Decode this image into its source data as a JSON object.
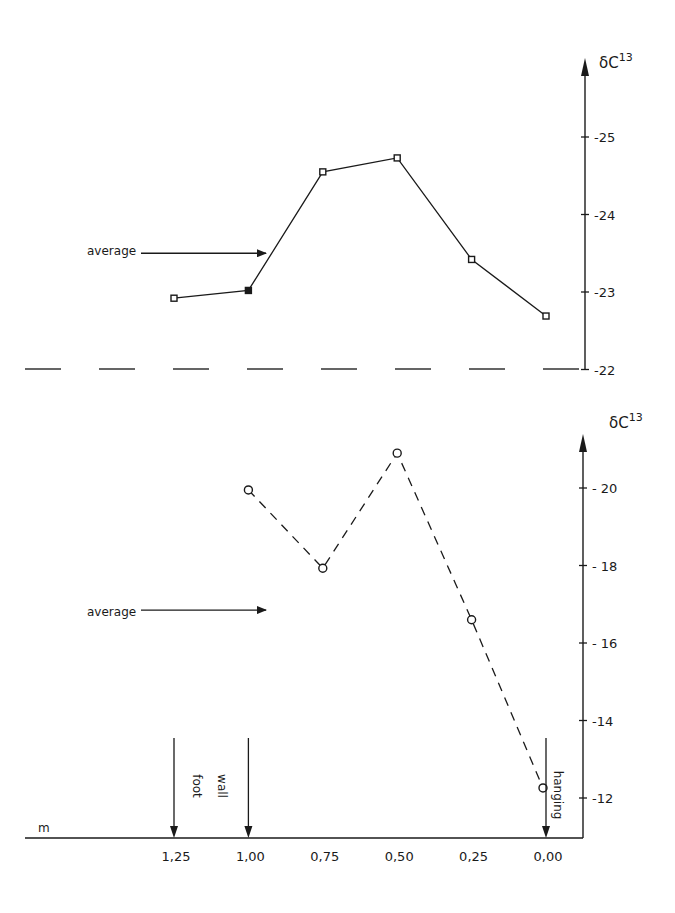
{
  "chart_data": [
    {
      "type": "line",
      "title": "",
      "ylabel": "δC13",
      "ylabel_sup": "13",
      "ylabel_base": "δC",
      "xlabel": "m",
      "x": [
        1.25,
        1.0,
        0.75,
        0.5,
        0.25,
        0.0
      ],
      "series": [
        {
          "name": "upper profile",
          "marker": "square",
          "line": "solid",
          "values": [
            -22.92,
            -23.02,
            -24.55,
            -24.73,
            -23.42,
            -22.69
          ]
        }
      ],
      "ylim": [
        -22,
        -25.5
      ],
      "yticks": [
        -25,
        -24,
        -23,
        -22
      ],
      "ytick_labels": [
        "-25",
        "-24",
        "-23",
        "-22"
      ],
      "reference_line": {
        "value": -22,
        "style": "dashed"
      },
      "annotations": [
        {
          "text": "average",
          "value": -23.5,
          "type": "arrow"
        }
      ],
      "grid": false
    },
    {
      "type": "line",
      "title": "",
      "ylabel": "δC13",
      "ylabel_sup": "13",
      "ylabel_base": "δC",
      "xlabel": "m",
      "x": [
        1.0,
        0.75,
        0.5,
        0.25,
        0.0
      ],
      "series": [
        {
          "name": "lower profile",
          "marker": "circle",
          "line": "dashed",
          "values": [
            -19.95,
            -17.93,
            -20.9,
            -16.6,
            -12.26
          ]
        }
      ],
      "xticks": [
        1.25,
        1.0,
        0.75,
        0.5,
        0.25,
        0.0
      ],
      "xtick_labels": [
        "1,25",
        "1,00",
        "0,75",
        "0,50",
        "0,25",
        "0,00"
      ],
      "ylim": [
        -11,
        -21.5
      ],
      "yticks": [
        -20,
        -18,
        -16,
        -14,
        -12
      ],
      "ytick_labels": [
        "- 20",
        "- 18",
        "- 16",
        "-14",
        "-12"
      ],
      "annotations": [
        {
          "text": "average",
          "value": -16.85,
          "type": "arrow"
        },
        {
          "text": "foot",
          "type": "vertical-label"
        },
        {
          "text": "wall",
          "type": "vertical-label"
        },
        {
          "text": "hanging",
          "type": "vertical-label"
        }
      ],
      "markers_down": [
        1.25,
        1.0,
        0.0
      ],
      "grid": false
    }
  ]
}
